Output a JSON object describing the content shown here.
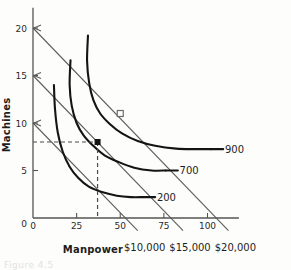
{
  "chart_data": {
    "type": "line",
    "title": "",
    "subtitle": "",
    "xlabel": "Manpower",
    "ylabel": "Machines",
    "xlim": [
      0,
      118
    ],
    "ylim": [
      0,
      21.5
    ],
    "xticks": [
      "0",
      "25",
      "50",
      "75",
      "100"
    ],
    "xtick_values": [
      0,
      25,
      50,
      75,
      100
    ],
    "yticks": [
      "0",
      "5",
      "10",
      "15",
      "20"
    ],
    "ytick_values": [
      0,
      5,
      10,
      15,
      20
    ],
    "grid": false,
    "legend_position": "inline-right",
    "series": [
      {
        "name": "200",
        "kind": "isoquant",
        "label": "200",
        "points": [
          [
            12,
            14.0
          ],
          [
            12.6,
            11.5
          ],
          [
            14.2,
            9.0
          ],
          [
            17.0,
            7.0
          ],
          [
            21.0,
            5.4
          ],
          [
            26.0,
            4.2
          ],
          [
            32.0,
            3.3
          ],
          [
            40.0,
            2.7
          ],
          [
            48.0,
            2.35
          ],
          [
            56.0,
            2.2
          ],
          [
            63.0,
            2.2
          ]
        ]
      },
      {
        "name": "700",
        "kind": "isoquant",
        "label": "700",
        "points": [
          [
            21.5,
            16.6
          ],
          [
            21.0,
            14.0
          ],
          [
            22.2,
            11.8
          ],
          [
            25.0,
            10.0
          ],
          [
            29.0,
            8.7
          ],
          [
            34.5,
            7.6
          ],
          [
            41.0,
            6.6
          ],
          [
            49.0,
            5.9
          ],
          [
            58.0,
            5.3
          ],
          [
            68.0,
            5.0
          ],
          [
            76.0,
            5.0
          ]
        ]
      },
      {
        "name": "900",
        "kind": "isoquant",
        "label": "900",
        "points": [
          [
            31.5,
            19.2
          ],
          [
            31.0,
            16.5
          ],
          [
            32.2,
            14.2
          ],
          [
            34.6,
            12.4
          ],
          [
            38.5,
            11.0
          ],
          [
            44.0,
            9.9
          ],
          [
            51.0,
            8.9
          ],
          [
            60.0,
            8.1
          ],
          [
            70.0,
            7.6
          ],
          [
            82.0,
            7.3
          ],
          [
            93.0,
            7.25
          ],
          [
            102.0,
            7.25
          ]
        ]
      }
    ],
    "isocost_lines": [
      {
        "name": "$10,000",
        "label": "$10,000",
        "y_intercept": 10,
        "x_intercept": 53,
        "label_x": 64,
        "label_y": -3.0
      },
      {
        "name": "$15,000",
        "label": "$15,000",
        "y_intercept": 15,
        "x_intercept": 79,
        "label_x": 90,
        "label_y": -3.0
      },
      {
        "name": "$20,000",
        "label": "$20,000",
        "y_intercept": 20,
        "x_intercept": 105,
        "label_x": 116,
        "label_y": -3.0
      }
    ],
    "markers": [
      {
        "name": "optimum-700",
        "style": "filled-square",
        "x": 37,
        "y": 8,
        "guides": true
      },
      {
        "name": "point-900",
        "style": "open-square",
        "x": 50,
        "y": 11,
        "guides": false
      }
    ],
    "annotations": [
      {
        "name": "curve-label-200",
        "text": "200",
        "x": 71,
        "y": 2.2
      },
      {
        "name": "curve-label-700",
        "text": "700",
        "x": 84,
        "y": 5.0
      },
      {
        "name": "curve-label-900",
        "text": "900",
        "x": 110,
        "y": 7.25
      }
    ]
  },
  "axes": {
    "x_title": "Manpower",
    "y_title": "Machines"
  },
  "caption": {
    "ghost_text": "Figure 4.5"
  }
}
